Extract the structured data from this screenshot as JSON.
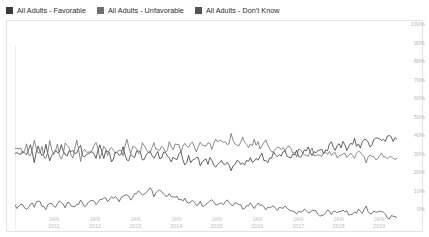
{
  "legend": {
    "position": "top-left",
    "items": [
      {
        "label": "All Adults - Favorable",
        "color": "#3a3a3a",
        "swatch_name": "legend-swatch-favorable"
      },
      {
        "label": "All Adults - Unfavorable",
        "color": "#6e6e6e",
        "swatch_name": "legend-swatch-unfavorable"
      },
      {
        "label": "All Adults - Don't Know",
        "color": "#545454",
        "swatch_name": "legend-swatch-dont-know"
      }
    ]
  },
  "axes": {
    "y_ticks": [
      "100%",
      "90%",
      "80%",
      "70%",
      "60%",
      "50%",
      "40%",
      "30%",
      "20%",
      "10%",
      "0%"
    ],
    "x_ticks": [
      {
        "month": "JAN",
        "year": "2011"
      },
      {
        "month": "JAN",
        "year": "2012"
      },
      {
        "month": "JAN",
        "year": "2013"
      },
      {
        "month": "JAN",
        "year": "2014"
      },
      {
        "month": "JAN",
        "year": "2015"
      },
      {
        "month": "JAN",
        "year": "2016"
      },
      {
        "month": "JAN",
        "year": "2017"
      },
      {
        "month": "JAN",
        "year": "2018"
      },
      {
        "month": "JAN",
        "year": "2019"
      }
    ]
  },
  "chart_data": {
    "type": "line",
    "title": "",
    "subtitle": "",
    "xlabel": "",
    "ylabel": "",
    "ylim": [
      0,
      100
    ],
    "ytick_step": 10,
    "grid": false,
    "legend_position": "top-left",
    "y_axis_side": "right",
    "x_start": "2010-07",
    "x_end": "2019-12",
    "x_tick_labels": [
      "JAN 2011",
      "JAN 2012",
      "JAN 2013",
      "JAN 2014",
      "JAN 2015",
      "JAN 2016",
      "JAN 2017",
      "JAN 2018",
      "JAN 2019"
    ],
    "x_tick_fractions": [
      0.105,
      0.212,
      0.318,
      0.425,
      0.531,
      0.637,
      0.744,
      0.85,
      0.956
    ],
    "series": [
      {
        "name": "All Adults - Favorable",
        "color": "#3a3a3a",
        "values": [
          42,
          40,
          43,
          39,
          45,
          38,
          44,
          40,
          46,
          37,
          43,
          41,
          45,
          39,
          42,
          44,
          40,
          46,
          38,
          43,
          41,
          39,
          45,
          40,
          43,
          38,
          42,
          40,
          44,
          36,
          41,
          39,
          43,
          38,
          40,
          42,
          38,
          41,
          39,
          43,
          37,
          40,
          38,
          41,
          36,
          39,
          37,
          40,
          35,
          38,
          36,
          39,
          34,
          37,
          35,
          38,
          33,
          36,
          38,
          35,
          37,
          39,
          36,
          38,
          40,
          37,
          39,
          41,
          38,
          40,
          42,
          39,
          41,
          43,
          40,
          42,
          44,
          41,
          43,
          45,
          42,
          44,
          46,
          43,
          45,
          47,
          44,
          46,
          48,
          45,
          47,
          49,
          46,
          48,
          50,
          47,
          49,
          51,
          48,
          50
        ],
        "start_value": 42,
        "end_value": 50,
        "min_value": 33,
        "max_value": 51
      },
      {
        "name": "All Adults - Unfavorable",
        "color": "#6e6e6e",
        "values": [
          43,
          45,
          40,
          46,
          39,
          47,
          41,
          44,
          38,
          48,
          42,
          45,
          39,
          46,
          43,
          40,
          47,
          38,
          45,
          41,
          43,
          46,
          39,
          44,
          41,
          46,
          42,
          44,
          40,
          48,
          43,
          45,
          41,
          46,
          44,
          42,
          46,
          43,
          45,
          41,
          47,
          44,
          46,
          43,
          48,
          45,
          47,
          44,
          49,
          46,
          48,
          45,
          50,
          47,
          49,
          46,
          51,
          48,
          46,
          49,
          47,
          45,
          48,
          46,
          44,
          47,
          45,
          43,
          46,
          44,
          42,
          45,
          43,
          41,
          44,
          42,
          40,
          43,
          41,
          39,
          42,
          40,
          42,
          41,
          39,
          41,
          40,
          42,
          39,
          41,
          40,
          38,
          41,
          39,
          40,
          42,
          39,
          41,
          40,
          40
        ],
        "start_value": 43,
        "end_value": 40,
        "min_value": 38,
        "max_value": 51
      },
      {
        "name": "All Adults - Don't Know",
        "color": "#545454",
        "values": [
          13,
          12,
          14,
          11,
          15,
          12,
          16,
          13,
          11,
          15,
          12,
          14,
          16,
          13,
          15,
          12,
          14,
          16,
          13,
          15,
          17,
          14,
          16,
          18,
          15,
          17,
          19,
          16,
          18,
          20,
          17,
          19,
          21,
          18,
          20,
          22,
          19,
          21,
          20,
          18,
          19,
          17,
          18,
          16,
          17,
          15,
          16,
          14,
          15,
          13,
          14,
          16,
          13,
          15,
          14,
          16,
          13,
          15,
          14,
          12,
          13,
          15,
          12,
          14,
          13,
          11,
          12,
          14,
          11,
          13,
          12,
          10,
          11,
          9,
          10,
          12,
          9,
          11,
          10,
          8,
          9,
          11,
          8,
          10,
          9,
          11,
          10,
          8,
          9,
          11,
          10,
          12,
          9,
          11,
          10,
          9,
          8,
          7,
          8,
          7
        ],
        "start_value": 13,
        "end_value": 7,
        "min_value": 7,
        "max_value": 22
      }
    ]
  }
}
